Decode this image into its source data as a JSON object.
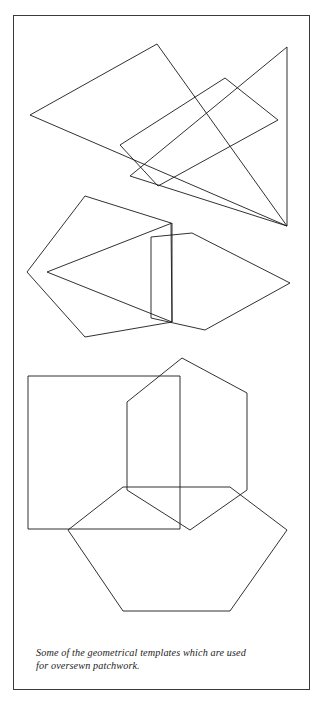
{
  "page": {
    "background_color": "#ffffff",
    "frame_color": "#3a3a3a",
    "ink_color": "#1a1a1a"
  },
  "figure": {
    "shapes": [
      {
        "name": "large-triangle-top-left",
        "type": "triangle",
        "points": "30,115 157,44 287,226"
      },
      {
        "name": "parallelogram-top",
        "type": "parallelogram",
        "points": "120,145 225,78 278,120 158,186"
      },
      {
        "name": "right-triangle-top-right",
        "type": "triangle",
        "points": "287,47 287,226 130,176"
      },
      {
        "name": "pentagon-middle-left",
        "type": "pentagon",
        "points": "27,272 85,196 171,223 172,322 85,337"
      },
      {
        "name": "triangle-middle-inner",
        "type": "triangle",
        "points": "47,272 172,223 172,322"
      },
      {
        "name": "pentagon-middle-right",
        "type": "pentagon",
        "points": "151,237 192,233 290,283 205,330 151,318"
      },
      {
        "name": "square-bottom-left",
        "type": "square",
        "points": "28,376 180,376 180,529 28,529"
      },
      {
        "name": "hexagon-bottom-upper",
        "type": "hexagon",
        "points": "127,402 182,358 247,393 247,490 190,530 127,490"
      },
      {
        "name": "hexagon-bottom-lower",
        "type": "hexagon",
        "points": "68,530 123,487 230,487 287,530 230,611 123,611"
      }
    ]
  },
  "caption": {
    "line1": "Some of the geometrical templates which are used",
    "line2": "for oversewn patchwork.",
    "text": "Some of the geometrical templates which are used for oversewn patchwork."
  }
}
